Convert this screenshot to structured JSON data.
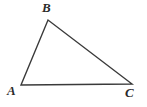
{
  "figure": {
    "name": "triangle-abc",
    "background_color": "#ffffff",
    "width": 147,
    "height": 107,
    "stroke_color": "#3a3a3a",
    "stroke_width": 1.4,
    "label_color": "#2b2b2b"
  },
  "vertices": [
    {
      "label": "A",
      "x": 21,
      "y": 85
    },
    {
      "label": "B",
      "x": 48,
      "y": 20
    },
    {
      "label": "C",
      "x": 132,
      "y": 84
    }
  ],
  "edges": [
    {
      "name": "side-AB",
      "from": "A",
      "to": "B"
    },
    {
      "name": "side-BC",
      "from": "B",
      "to": "C"
    },
    {
      "name": "side-AC",
      "from": "A",
      "to": "C"
    }
  ],
  "polygon_points": "21,85 48,20 132,84"
}
